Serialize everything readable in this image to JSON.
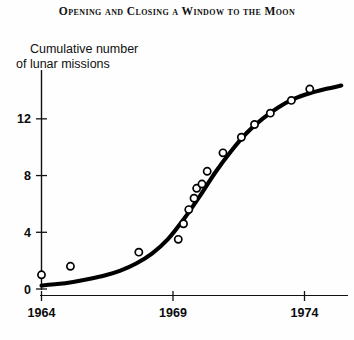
{
  "figure": {
    "title": "Opening and Closing a Window to the Moon",
    "ylabel_line1": "Cumulative number",
    "ylabel_line2": "of lunar missions"
  },
  "axes": {
    "x_ticks": [
      "1964",
      "1969",
      "1974"
    ],
    "y_ticks": [
      "0",
      "4",
      "8",
      "12"
    ]
  },
  "colors": {
    "ink": "#000000",
    "background": "#fefefe",
    "curve": "#000000",
    "marker_stroke": "#000000",
    "marker_fill": "#ffffff"
  },
  "chart_data": {
    "type": "scatter",
    "title": "Opening and Closing a Window to the Moon",
    "xlabel": "",
    "ylabel": "Cumulative number of lunar missions",
    "xlim": [
      1963.6,
      1975.5
    ],
    "ylim": [
      0,
      15.6
    ],
    "xticks": [
      1964,
      1969,
      1974
    ],
    "yticks": [
      0,
      4,
      8,
      12
    ],
    "grid": false,
    "legend": null,
    "series": [
      {
        "name": "Observed cumulative lunar missions",
        "type": "scatter",
        "marker": "open-circle",
        "points": [
          {
            "x": 1964.0,
            "y": 1.0
          },
          {
            "x": 1965.1,
            "y": 1.6
          },
          {
            "x": 1967.7,
            "y": 2.6
          },
          {
            "x": 1969.2,
            "y": 3.5
          },
          {
            "x": 1969.4,
            "y": 4.6
          },
          {
            "x": 1969.6,
            "y": 5.6
          },
          {
            "x": 1969.8,
            "y": 6.4
          },
          {
            "x": 1969.9,
            "y": 7.1
          },
          {
            "x": 1970.1,
            "y": 7.4
          },
          {
            "x": 1970.3,
            "y": 8.3
          },
          {
            "x": 1970.9,
            "y": 9.6
          },
          {
            "x": 1971.6,
            "y": 10.7
          },
          {
            "x": 1972.1,
            "y": 11.6
          },
          {
            "x": 1972.7,
            "y": 12.4
          },
          {
            "x": 1973.5,
            "y": 13.3
          },
          {
            "x": 1974.2,
            "y": 14.1
          }
        ]
      },
      {
        "name": "Fitted logistic curve",
        "type": "line",
        "points": [
          {
            "x": 1964.0,
            "y": 0.25
          },
          {
            "x": 1964.6,
            "y": 0.35
          },
          {
            "x": 1965.2,
            "y": 0.5
          },
          {
            "x": 1965.8,
            "y": 0.7
          },
          {
            "x": 1966.4,
            "y": 0.95
          },
          {
            "x": 1967.0,
            "y": 1.3
          },
          {
            "x": 1967.6,
            "y": 1.8
          },
          {
            "x": 1968.2,
            "y": 2.5
          },
          {
            "x": 1968.8,
            "y": 3.5
          },
          {
            "x": 1969.4,
            "y": 4.9
          },
          {
            "x": 1970.0,
            "y": 6.5
          },
          {
            "x": 1970.6,
            "y": 8.2
          },
          {
            "x": 1971.2,
            "y": 9.7
          },
          {
            "x": 1971.8,
            "y": 11.0
          },
          {
            "x": 1972.4,
            "y": 12.0
          },
          {
            "x": 1973.0,
            "y": 12.8
          },
          {
            "x": 1973.6,
            "y": 13.4
          },
          {
            "x": 1974.2,
            "y": 13.8
          },
          {
            "x": 1974.8,
            "y": 14.1
          },
          {
            "x": 1975.4,
            "y": 14.35
          }
        ]
      }
    ]
  }
}
